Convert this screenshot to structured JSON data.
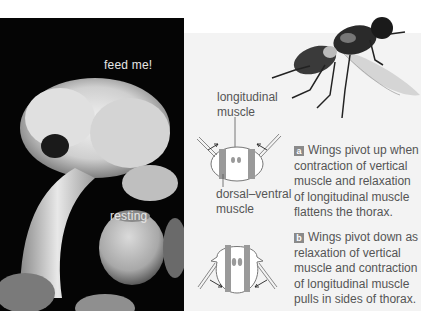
{
  "photo": {
    "subject": "sea-anemone-photo",
    "labels": {
      "top": "feed me!",
      "bottom": "resting"
    }
  },
  "fly": {
    "subject": "housefly-illustration"
  },
  "diagram_a": {
    "label_top": "longitudinal\nmuscle",
    "label_top_line1": "longitudinal",
    "label_top_line2": "muscle",
    "label_bottom_line1": "dorsal–ventral",
    "label_bottom_line2": "muscle",
    "badge": "a",
    "caption": "Wings pivot up when contraction of vertical muscle and relaxation of longitudinal muscle flattens the thorax."
  },
  "diagram_b": {
    "badge": "b",
    "caption": "Wings pivot down as relaxation of vertical muscle and contraction of longitudinal muscle pulls in sides of thorax."
  },
  "colors": {
    "panel_bg": "#f3f3f3",
    "photo_bg": "#050505",
    "muscle_gray": "#9a9a9a",
    "badge_gray": "#8a8a8a",
    "text": "#555555"
  }
}
